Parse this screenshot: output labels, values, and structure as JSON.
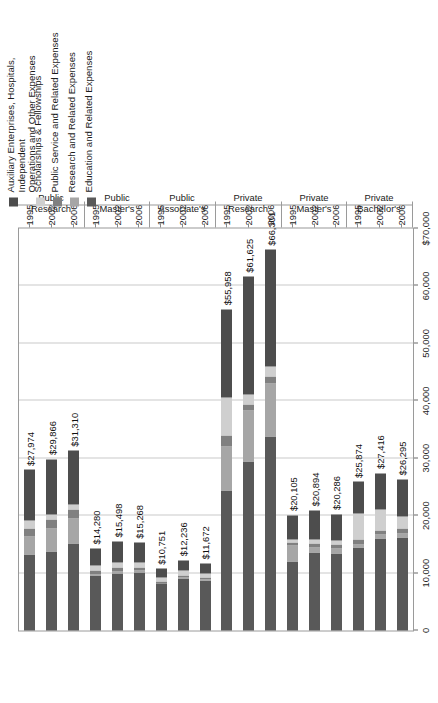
{
  "chart_data": {
    "type": "bar",
    "orientation": "horizontal-stacked",
    "title": "",
    "xlabel": "",
    "ylabel": "",
    "xlim": [
      0,
      70000
    ],
    "grid": true,
    "legend_position": "right",
    "axis_ticks": [
      "$70,000",
      "60,000",
      "50,000",
      "40,000",
      "30,000",
      "20,000",
      "10,000",
      "0"
    ],
    "axis_tick_values": [
      70000,
      60000,
      50000,
      40000,
      30000,
      20000,
      10000,
      0
    ],
    "series": [
      {
        "name": "Education and Related Expenses",
        "color": "#595959"
      },
      {
        "name": "Research and Related Expenses",
        "color": "#a6a6a6"
      },
      {
        "name": "Public Service and Related Expenses",
        "color": "#808080"
      },
      {
        "name": "Scholarships & Fellowships",
        "color": "#cfcfcf"
      },
      {
        "name": "Auxiliary Enterprises, Hospitals, Independent Operations and Other Expenses",
        "color": "#4d4d4d"
      }
    ],
    "groups": [
      {
        "label": "Public Research",
        "rows": [
          {
            "year": "1995",
            "total_label": "$27,974",
            "total": 27974,
            "values": [
              13200,
              3100,
              1400,
              1500,
              8774
            ]
          },
          {
            "year": "2002",
            "total_label": "$29,866",
            "total": 29866,
            "values": [
              13700,
              4100,
              1500,
              900,
              9666
            ]
          },
          {
            "year": "2006",
            "total_label": "$31,310",
            "total": 31310,
            "values": [
              15200,
              4300,
              1500,
              900,
              9410
            ]
          }
        ]
      },
      {
        "label": "Public Master's",
        "rows": [
          {
            "year": "1995",
            "total_label": "$14,280",
            "total": 14280,
            "values": [
              9500,
              300,
              600,
              900,
              2980
            ]
          },
          {
            "year": "2002",
            "total_label": "$15,498",
            "total": 15498,
            "values": [
              10000,
              350,
              600,
              900,
              3648
            ]
          },
          {
            "year": "2006",
            "total_label": "$15,268",
            "total": 15268,
            "values": [
              10100,
              350,
              550,
              900,
              3368
            ]
          }
        ]
      },
      {
        "label": "Public Associate's",
        "rows": [
          {
            "year": "1995",
            "total_label": "$10,751",
            "total": 10751,
            "values": [
              8100,
              100,
              300,
              700,
              1551
            ]
          },
          {
            "year": "2002",
            "total_label": "$12,236",
            "total": 12236,
            "values": [
              9100,
              100,
              350,
              900,
              1786
            ]
          },
          {
            "year": "2006",
            "total_label": "$11,672",
            "total": 11672,
            "values": [
              8700,
              100,
              350,
              800,
              1722
            ]
          }
        ]
      },
      {
        "label": "Private Research",
        "rows": [
          {
            "year": "1995",
            "total_label": "$55,958",
            "total": 55958,
            "values": [
              24400,
              7600,
              1900,
              6600,
              15458
            ]
          },
          {
            "year": "2002",
            "total_label": "$61,625",
            "total": 61625,
            "values": [
              29400,
              8900,
              1100,
              1700,
              20525
            ]
          },
          {
            "year": "2006",
            "total_label": "$66,301",
            "total": 66301,
            "values": [
              33800,
              9200,
              1200,
              1700,
              20401
            ]
          }
        ]
      },
      {
        "label": "Private Master's",
        "rows": [
          {
            "year": "1995",
            "total_label": "$20,105",
            "total": 20105,
            "values": [
              12100,
              2700,
              500,
              500,
              4305
            ]
          },
          {
            "year": "2002",
            "total_label": "$20,894",
            "total": 20894,
            "values": [
              13600,
              900,
              600,
              800,
              4994
            ]
          },
          {
            "year": "2006",
            "total_label": "$20,286",
            "total": 20286,
            "values": [
              13400,
              900,
              600,
              800,
              4586
            ]
          }
        ]
      },
      {
        "label": "Private Bachelor's",
        "rows": [
          {
            "year": "1995",
            "total_label": "$25,874",
            "total": 25874,
            "values": [
              14400,
              600,
              900,
              4500,
              5474
            ]
          },
          {
            "year": "2002",
            "total_label": "$27,416",
            "total": 27416,
            "values": [
              16000,
              700,
              800,
              3600,
              6316
            ]
          },
          {
            "year": "2006",
            "total_label": "$26,295",
            "total": 26295,
            "values": [
              16200,
              700,
              800,
              2100,
              6495
            ]
          }
        ]
      }
    ]
  }
}
